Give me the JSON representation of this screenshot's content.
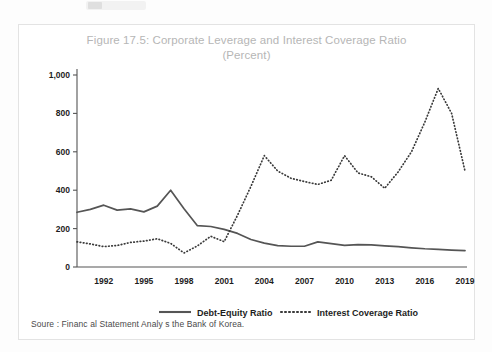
{
  "figure": {
    "title_line1": "Figure 17.5: Corporate Leverage and Interest Coverage Ratio",
    "title_line2": "(Percent)",
    "source_note": "Soure : Financ al Statement Analy  s  the Bank of Korea."
  },
  "legend": {
    "debt_label": "Debt-Equity Ratio",
    "icr_label": "Interest Coverage Ratio"
  },
  "chart_data": {
    "type": "line",
    "title": "Figure 17.5: Corporate Leverage and Interest Coverage Ratio (Percent)",
    "xlabel": "",
    "ylabel": "Percent",
    "ylim": [
      0,
      1000
    ],
    "yticks": [
      0,
      200,
      400,
      600,
      800,
      1000
    ],
    "ytick_labels": [
      "0",
      "200",
      "400",
      "600",
      "800",
      "1,000"
    ],
    "xlim": [
      1990,
      2019
    ],
    "xticks": [
      1992,
      1995,
      1998,
      2001,
      2004,
      2007,
      2010,
      2013,
      2016,
      2019
    ],
    "xtick_labels": [
      "1992",
      "1995",
      "1998",
      "2001",
      "2004",
      "2007",
      "2010",
      "2013",
      "2016",
      "2019"
    ],
    "grid": false,
    "legend_position": "bottom",
    "x": [
      1990,
      1991,
      1992,
      1993,
      1994,
      1995,
      1996,
      1997,
      1998,
      1999,
      2000,
      2001,
      2002,
      2003,
      2004,
      2005,
      2006,
      2007,
      2008,
      2009,
      2010,
      2011,
      2012,
      2013,
      2014,
      2015,
      2016,
      2017,
      2018,
      2019
    ],
    "series": [
      {
        "name": "Debt-Equity Ratio",
        "style": "solid",
        "color": "#555555",
        "values": [
          285,
          300,
          322,
          296,
          303,
          287,
          317,
          400,
          303,
          215,
          211,
          196,
          175,
          143,
          124,
          111,
          108,
          108,
          131,
          122,
          113,
          117,
          115,
          110,
          106,
          100,
          95,
          92,
          88,
          85
        ]
      },
      {
        "name": "Interest Coverage Ratio",
        "style": "dotted",
        "color": "#3a3a3a",
        "values": [
          131,
          120,
          106,
          112,
          128,
          135,
          147,
          123,
          73,
          110,
          160,
          132,
          270,
          420,
          580,
          500,
          462,
          445,
          430,
          452,
          580,
          490,
          470,
          410,
          495,
          600,
          755,
          930,
          800,
          500
        ]
      }
    ]
  }
}
